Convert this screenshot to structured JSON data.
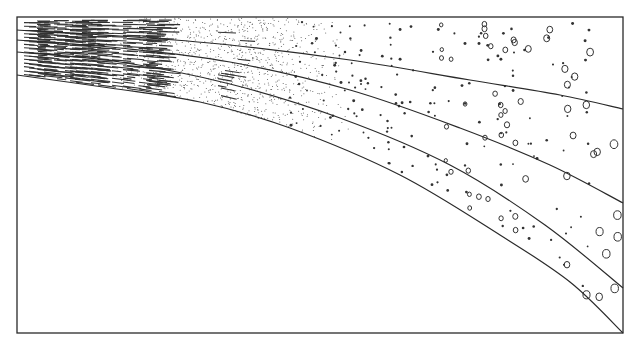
{
  "diagram": {
    "frame": {
      "x": 17,
      "y": 17,
      "width": 606,
      "height": 316
    },
    "colors": {
      "ink": "#2a2a2a",
      "background": "#ffffff"
    },
    "boundaries": [
      {
        "id": "b1",
        "points": [
          [
            17,
            30
          ],
          [
            120,
            36
          ],
          [
            230,
            45
          ],
          [
            350,
            60
          ],
          [
            470,
            80
          ],
          [
            560,
            95
          ],
          [
            623,
            109
          ]
        ]
      },
      {
        "id": "b2",
        "points": [
          [
            17,
            40
          ],
          [
            120,
            48
          ],
          [
            230,
            62
          ],
          [
            350,
            90
          ],
          [
            460,
            128
          ],
          [
            550,
            165
          ],
          [
            623,
            203
          ]
        ]
      },
      {
        "id": "b3",
        "points": [
          [
            17,
            52
          ],
          [
            120,
            62
          ],
          [
            230,
            84
          ],
          [
            340,
            118
          ],
          [
            450,
            165
          ],
          [
            545,
            225
          ],
          [
            623,
            288
          ]
        ]
      },
      {
        "id": "b4",
        "points": [
          [
            17,
            75
          ],
          [
            110,
            88
          ],
          [
            200,
            102
          ],
          [
            290,
            128
          ],
          [
            400,
            175
          ],
          [
            500,
            235
          ],
          [
            570,
            282
          ],
          [
            623,
            333
          ]
        ]
      }
    ],
    "zones": [
      {
        "name": "laminated-mud",
        "texture": "dashes",
        "x_range": [
          17,
          240
        ]
      },
      {
        "name": "fine-sand",
        "texture": "fine-stipple",
        "x_range": [
          120,
          330
        ]
      },
      {
        "name": "coarse-sand",
        "texture": "dots",
        "x_range": [
          300,
          560
        ]
      },
      {
        "name": "pebbles",
        "texture": "circles",
        "x_range": [
          440,
          623
        ]
      }
    ],
    "labels": []
  }
}
